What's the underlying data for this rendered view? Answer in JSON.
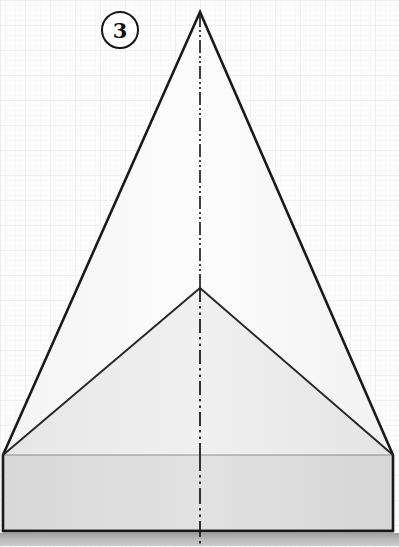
{
  "figure": {
    "step_badge": {
      "number": "3",
      "shape": "circle"
    },
    "canvas": {
      "width": 399,
      "height": 547,
      "background_color": "#fdfdfd",
      "grid": {
        "visible": true,
        "major_spacing_px": 25,
        "minor_spacing_px": 5,
        "color": "#f2f2f2"
      }
    },
    "colors": {
      "outline": "#1a1a1a",
      "fold_line": "#262626",
      "center_line": "#1f1f1f",
      "panel_upper_left": "#fbfbfb",
      "panel_upper_right": "#f7f7f7",
      "panel_mid_left": "#ebebeb",
      "panel_mid_right": "#e7e7e7",
      "panel_base_left": "#dedede",
      "panel_base_right": "#dadada",
      "ground_band": "#b4b4b4"
    },
    "geometry": {
      "apex": [
        200,
        12
      ],
      "left_corner": [
        3,
        455
      ],
      "right_corner": [
        393,
        455
      ],
      "center_junction": [
        200,
        288
      ],
      "base_bottom_left": [
        3,
        531
      ],
      "base_bottom_right": [
        393,
        531
      ],
      "center_axis_x": 200,
      "ground_band_top_y": 533,
      "ground_band_bottom_y": 546
    },
    "elements": {
      "outer_triangle_label": "Outer triangle outline",
      "left_fold_label": "Left diagonal fold line",
      "right_fold_label": "Right diagonal fold line",
      "center_line_label": "Center phantom fold line",
      "base_label": "Rectangular base panel",
      "ground_label": "Ground shadow band"
    }
  }
}
